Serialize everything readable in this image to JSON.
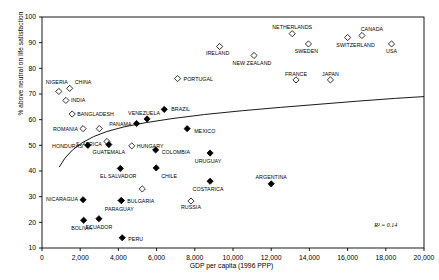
{
  "chart_data": {
    "type": "scatter",
    "title": "",
    "xlabel": "GDP per capita (1996 PPP)",
    "ylabel": "% above neutral on life satisfaction",
    "xlim": [
      0,
      20000
    ],
    "ylim": [
      10,
      100
    ],
    "xticks": [
      0,
      2000,
      4000,
      6000,
      8000,
      10000,
      12000,
      14000,
      16000,
      18000,
      20000
    ],
    "xticklabels": [
      "0",
      "2,000",
      "4,000",
      "6,000",
      "8,000",
      "10,000",
      "12,000",
      "14,000",
      "16,000",
      "18,000",
      "20,000"
    ],
    "yticks": [
      10,
      20,
      30,
      40,
      50,
      60,
      70,
      80,
      90,
      100
    ],
    "yticklabels": [
      "10",
      "20",
      "30",
      "40",
      "50",
      "60",
      "70",
      "80",
      "90",
      "100"
    ],
    "grid": false,
    "legend": "none",
    "annotations": [
      {
        "name": "r-squared",
        "text": "R² = 0.14",
        "x": 18000,
        "y": 18
      }
    ],
    "trendline": {
      "style": "logarithmic-fit",
      "points": [
        [
          900,
          41.5
        ],
        [
          1200,
          45.0
        ],
        [
          1600,
          48.2
        ],
        [
          2100,
          51.0
        ],
        [
          2700,
          53.4
        ],
        [
          3400,
          55.4
        ],
        [
          4300,
          57.2
        ],
        [
          5400,
          58.8
        ],
        [
          6800,
          60.4
        ],
        [
          8500,
          62.0
        ],
        [
          10500,
          63.5
        ],
        [
          12500,
          64.8
        ],
        [
          14500,
          66.0
        ],
        [
          16500,
          67.2
        ],
        [
          18500,
          68.3
        ],
        [
          20000,
          69.0
        ]
      ]
    },
    "series": [
      {
        "name": "Open diamonds",
        "marker": "open-diamond",
        "points": [
          {
            "label": "NIGERIA",
            "x": 880,
            "y": 71.0,
            "lx": -2,
            "ly": -7,
            "anchor": "middle"
          },
          {
            "label": "CHINA",
            "x": 1450,
            "y": 72.2,
            "lx": 5,
            "ly": -4,
            "anchor": "start"
          },
          {
            "label": "INDIA",
            "x": 1250,
            "y": 67.5,
            "lx": 5,
            "ly": 2,
            "anchor": "start"
          },
          {
            "label": "BANGLADESH",
            "x": 1580,
            "y": 62.2,
            "lx": 5,
            "ly": 2,
            "anchor": "start"
          },
          {
            "label": "ROMANIA",
            "x": 2150,
            "y": 56.5,
            "lx": -5,
            "ly": 2,
            "anchor": "end"
          },
          {
            "label": "",
            "x": 3000,
            "y": 56.5,
            "lx": 0,
            "ly": 0,
            "anchor": "middle"
          },
          {
            "label": "S. AFRICA",
            "x": 3400,
            "y": 51.5,
            "lx": -5,
            "ly": 5,
            "anchor": "end"
          },
          {
            "label": "HUNGARY",
            "x": 4700,
            "y": 49.8,
            "lx": 5,
            "ly": 2,
            "anchor": "start"
          },
          {
            "label": "",
            "x": 5250,
            "y": 33.0,
            "lx": 0,
            "ly": 0,
            "anchor": "middle"
          },
          {
            "label": "RUSSIA",
            "x": 7800,
            "y": 28.3,
            "lx": 0,
            "ly": 8,
            "anchor": "middle"
          },
          {
            "label": "PORTUGAL",
            "x": 7100,
            "y": 76.0,
            "lx": 6,
            "ly": 2,
            "anchor": "start"
          },
          {
            "label": "IRELAND",
            "x": 9300,
            "y": 88.5,
            "lx": -2,
            "ly": 8,
            "anchor": "middle"
          },
          {
            "label": "NEW ZEALAND",
            "x": 11100,
            "y": 85.0,
            "lx": -2,
            "ly": 9,
            "anchor": "middle"
          },
          {
            "label": "NETHERLANDS",
            "x": 13100,
            "y": 93.5,
            "lx": 0,
            "ly": -5,
            "anchor": "middle"
          },
          {
            "label": "SWEDEN",
            "x": 13950,
            "y": 89.5,
            "lx": -2,
            "ly": 9,
            "anchor": "middle"
          },
          {
            "label": "FRANCE",
            "x": 13300,
            "y": 75.5,
            "lx": 0,
            "ly": -4,
            "anchor": "middle"
          },
          {
            "label": "JAPAN",
            "x": 15100,
            "y": 75.5,
            "lx": 0,
            "ly": -4,
            "anchor": "middle"
          },
          {
            "label": "SWITZERLAND",
            "x": 16000,
            "y": 92.0,
            "lx": 8,
            "ly": 9,
            "anchor": "middle"
          },
          {
            "label": "CANADA",
            "x": 16750,
            "y": 92.8,
            "lx": 10,
            "ly": -4,
            "anchor": "middle"
          },
          {
            "label": "USA",
            "x": 18300,
            "y": 89.5,
            "lx": 0,
            "ly": 9,
            "anchor": "middle"
          }
        ]
      },
      {
        "name": "Filled diamonds",
        "marker": "filled-diamond",
        "points": [
          {
            "label": "HONDURAS",
            "x": 2400,
            "y": 50.0,
            "lx": -5,
            "ly": 3,
            "anchor": "end"
          },
          {
            "label": "NICARAGUA",
            "x": 2150,
            "y": 28.8,
            "lx": -5,
            "ly": 1,
            "anchor": "end"
          },
          {
            "label": "BOLIVIA",
            "x": 2180,
            "y": 20.8,
            "lx": -2,
            "ly": 10,
            "anchor": "middle"
          },
          {
            "label": "ECUADOR",
            "x": 2980,
            "y": 21.4,
            "lx": 0,
            "ly": 10,
            "anchor": "middle"
          },
          {
            "label": "GUATEMALA",
            "x": 3500,
            "y": 50.3,
            "lx": 0,
            "ly": 9,
            "anchor": "middle"
          },
          {
            "label": "EL SALVADOR",
            "x": 4100,
            "y": 41.0,
            "lx": -2,
            "ly": 10,
            "anchor": "middle"
          },
          {
            "label": "PARAGUAY",
            "x": 4150,
            "y": 28.5,
            "lx": -2,
            "ly": 10,
            "anchor": "middle"
          },
          {
            "label": "BULGARIA",
            "x": 4150,
            "y": 28.5,
            "lx": 6,
            "ly": 2,
            "anchor": "start"
          },
          {
            "label": "PERU",
            "x": 4200,
            "y": 14.0,
            "lx": 6,
            "ly": 3,
            "anchor": "start"
          },
          {
            "label": "PANAMA",
            "x": 4950,
            "y": 58.5,
            "lx": -5,
            "ly": 2,
            "anchor": "end"
          },
          {
            "label": "VENEZUELA",
            "x": 5500,
            "y": 60.3,
            "lx": -3,
            "ly": -4,
            "anchor": "middle"
          },
          {
            "label": "COLOMBIA",
            "x": 5950,
            "y": 48.2,
            "lx": 6,
            "ly": 4,
            "anchor": "start"
          },
          {
            "label": "CHILE",
            "x": 5980,
            "y": 41.2,
            "lx": 5,
            "ly": 10,
            "anchor": "start"
          },
          {
            "label": "BRAZIL",
            "x": 6400,
            "y": 64.0,
            "lx": 7,
            "ly": 2,
            "anchor": "start"
          },
          {
            "label": "MEXICO",
            "x": 7600,
            "y": 56.5,
            "lx": 7,
            "ly": 4,
            "anchor": "start"
          },
          {
            "label": "URUGUAY",
            "x": 8800,
            "y": 47.0,
            "lx": -2,
            "ly": 10,
            "anchor": "middle"
          },
          {
            "label": "COSTARICA",
            "x": 8800,
            "y": 36.0,
            "lx": -2,
            "ly": 10,
            "anchor": "middle"
          },
          {
            "label": "ARGENTINA",
            "x": 12000,
            "y": 35.0,
            "lx": 0,
            "ly": -5,
            "anchor": "middle"
          }
        ]
      }
    ]
  }
}
